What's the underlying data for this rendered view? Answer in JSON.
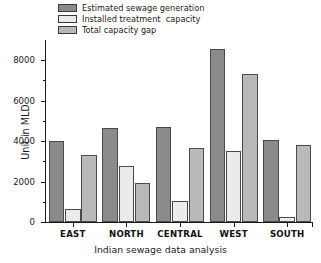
{
  "chart_data": {
    "type": "bar",
    "title": "",
    "xlabel": "Indian sewage data analysis",
    "ylabel": "Unit in MLD",
    "categories": [
      "EAST",
      "NORTH",
      "CENTRAL",
      "WEST",
      "SOUTH"
    ],
    "series": [
      {
        "name": "Estimated sewage generation",
        "color": "#8b8b8b",
        "values": [
          4000,
          4660,
          4690,
          8550,
          4080
        ]
      },
      {
        "name": "Installed treatment  capacity",
        "color": "#ebebeb",
        "values": [
          650,
          2750,
          1020,
          3520,
          230
        ]
      },
      {
        "name": "Total capacity gap",
        "color": "#b9b9b9",
        "values": [
          3330,
          1940,
          3650,
          7320,
          3830
        ]
      }
    ],
    "ylim": [
      0,
      9000
    ],
    "yticks": [
      0,
      2000,
      4000,
      6000,
      8000
    ],
    "ytick_labels": [
      "0",
      "2000",
      "4000",
      "6000",
      "8000"
    ],
    "yticks_minor": [
      1000,
      3000,
      5000,
      7000
    ],
    "grid": false,
    "legend_position": "top-left"
  },
  "axis": {
    "y_title": "Unit in MLD",
    "x_title": "Indian sewage data analysis"
  },
  "legend": {
    "items": [
      {
        "label": "Estimated sewage generation",
        "color": "#8b8b8b"
      },
      {
        "label": "Installed treatment  capacity",
        "color": "#ebebeb"
      },
      {
        "label": "Total capacity gap",
        "color": "#b9b9b9"
      }
    ]
  }
}
